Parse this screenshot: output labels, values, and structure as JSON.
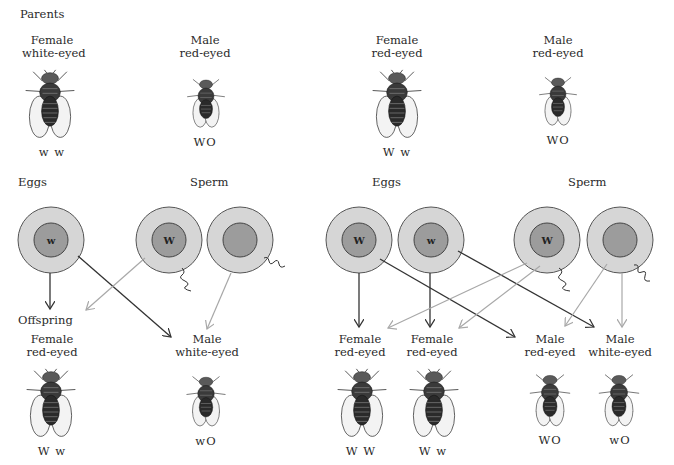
{
  "section_labels": {
    "parents": "Parents",
    "eggs_left": "Eggs",
    "sperm_left": "Sperm",
    "eggs_right": "Eggs",
    "sperm_right": "Sperm",
    "offspring": "Offspring"
  },
  "left_cross": {
    "parents": [
      {
        "sex": "Female",
        "phenotype": "white-eyed",
        "genotype": "w w"
      },
      {
        "sex": "Male",
        "phenotype": "red-eyed",
        "genotype": "WO"
      }
    ],
    "eggs": [
      {
        "allele": "w"
      }
    ],
    "sperm": [
      {
        "allele": "W"
      },
      {
        "allele": ""
      }
    ],
    "offspring": [
      {
        "sex": "Female",
        "phenotype": "red-eyed",
        "genotype": "W w"
      },
      {
        "sex": "Male",
        "phenotype": "white-eyed",
        "genotype": "wO"
      }
    ]
  },
  "right_cross": {
    "parents": [
      {
        "sex": "Female",
        "phenotype": "red-eyed",
        "genotype": "W w"
      },
      {
        "sex": "Male",
        "phenotype": "red-eyed",
        "genotype": "WO"
      }
    ],
    "eggs": [
      {
        "allele": "W"
      },
      {
        "allele": "w"
      }
    ],
    "sperm": [
      {
        "allele": "W"
      },
      {
        "allele": ""
      }
    ],
    "offspring": [
      {
        "sex": "Female",
        "phenotype": "red-eyed",
        "genotype": "W W"
      },
      {
        "sex": "Female",
        "phenotype": "red-eyed",
        "genotype": "W w"
      },
      {
        "sex": "Male",
        "phenotype": "red-eyed",
        "genotype": "WO"
      },
      {
        "sex": "Male",
        "phenotype": "white-eyed",
        "genotype": "wO"
      }
    ]
  },
  "colors": {
    "cell_outer": "#d6d6d6",
    "cell_inner": "#9c9c9c",
    "cell_border": "#555555",
    "egg_arrow": "#333333",
    "sperm_arrow": "#a8a8a8",
    "text": "#2a2a2a"
  }
}
